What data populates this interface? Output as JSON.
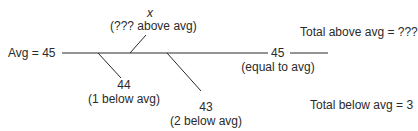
{
  "avg_label": "Avg = 45",
  "above": {
    "value": "x",
    "note": "(??? above avg)"
  },
  "equal": {
    "value": "45",
    "note": "(equal to avg)"
  },
  "below1": {
    "value": "44",
    "note": "(1 below avg)"
  },
  "below2": {
    "value": "43",
    "note": "(2 below avg)"
  },
  "total_above": "Total above avg = ???",
  "total_below": "Total below avg = 3",
  "colors": {
    "line": "#2a2a2a",
    "text": "#2a2a2a"
  }
}
